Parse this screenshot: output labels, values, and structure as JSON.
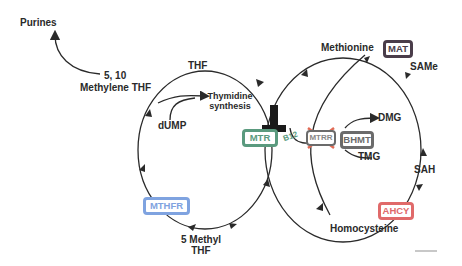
{
  "diagram": {
    "type": "folate-methionine cycle pathway",
    "labels": {
      "purines": "Purines",
      "methylene_thf_num": "5, 10",
      "methylene_thf": "Methylene THF",
      "thf": "THF",
      "thymidine_1": "Thymidine",
      "thymidine_2": "synthesis",
      "dump": "dUMP",
      "methyl_thf_1": "5 Methyl",
      "methyl_thf_2": "THF",
      "methionine": "Methionine",
      "same": "SAMe",
      "sah": "SAH",
      "homocysteine": "Homocysteine",
      "dmg": "DMG",
      "tmg": "TMG",
      "b12": "B12"
    },
    "enzymes": {
      "mtr": {
        "label": "MTR",
        "color": "#5a9a7e"
      },
      "mthfr": {
        "label": "MTHFR",
        "color": "#7fa3e0"
      },
      "mtrr": {
        "label": "MTRR",
        "color": "#6b6b6b",
        "crossed_out": true,
        "cross_color": "#e06a55"
      },
      "bhmt": {
        "label": "BHMT",
        "color": "#6b6b6b"
      },
      "mat": {
        "label": "MAT",
        "color": "#4a3d4a"
      },
      "ahcy": {
        "label": "AHCY",
        "color": "#e06a6a"
      }
    },
    "inhibitor_symbol": "T-bar block on MTR",
    "colors": {
      "line": "#2a2a2a",
      "text": "#2a2a2a"
    }
  }
}
